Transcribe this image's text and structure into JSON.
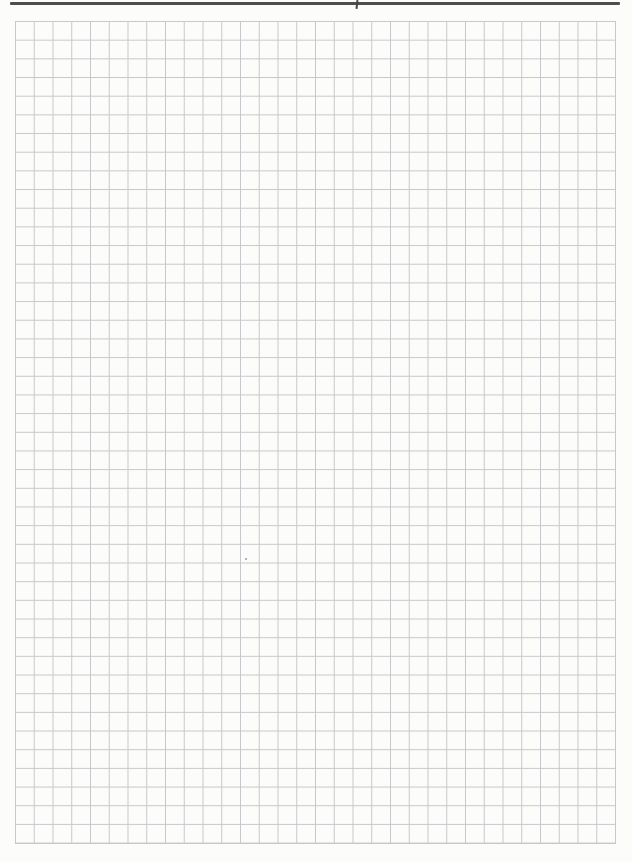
{
  "page": {
    "width_px": 632,
    "height_px": 862
  },
  "header_rule": {
    "present": true,
    "tick_mark_present": true
  },
  "grid": {
    "columns": 32,
    "rows": 44
  },
  "artifacts": {
    "speck_present": true
  },
  "theme": {
    "page-bg": "#fcfcfa",
    "grid-line": "#c8c8cc",
    "rule-color": "#4e4e4e",
    "tick-color": "#454545",
    "speck-color": "#9b9b9b"
  }
}
